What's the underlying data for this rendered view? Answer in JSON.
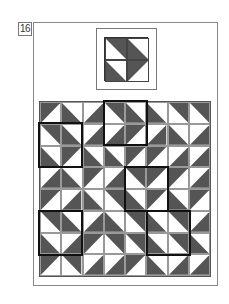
{
  "puzzle": {
    "number": "16",
    "dark_color": "#555555",
    "light_color": "#ffffff",
    "key": {
      "rows": 2,
      "cols": 2,
      "cells": [
        [
          "TR",
          "BL"
        ],
        [
          "BL",
          "TL"
        ]
      ]
    },
    "grid": {
      "rows": 8,
      "cols": 8,
      "cells": [
        [
          "TL",
          "BL",
          "BR",
          "TR",
          "BL",
          "BL",
          "TR",
          "TR"
        ],
        [
          "TR",
          "BL",
          "BR",
          "BR",
          "TL",
          "BR",
          "BL",
          "BR"
        ],
        [
          "BL",
          "TL",
          "BL",
          "BL",
          "TL",
          "TL",
          "BR",
          "BR"
        ],
        [
          "BR",
          "BL",
          "TL",
          "BR",
          "TR",
          "TL",
          "TL",
          "BR"
        ],
        [
          "TL",
          "BR",
          "BL",
          "TR",
          "BL",
          "TL",
          "BL",
          "TL"
        ],
        [
          "TR",
          "BL",
          "BR",
          "BL",
          "TR",
          "BL",
          "TR",
          "BR"
        ],
        [
          "BL",
          "BR",
          "TL",
          "TR",
          "TR",
          "BL",
          "TR",
          "BL"
        ],
        [
          "TL",
          "TR",
          "BR",
          "BR",
          "TL",
          "BL",
          "BR",
          "BR"
        ]
      ]
    },
    "highlighted_blocks": [
      {
        "row": 0,
        "col": 3,
        "size": 2
      },
      {
        "row": 1,
        "col": 0,
        "size": 2
      },
      {
        "row": 3,
        "col": 4,
        "size": 2
      },
      {
        "row": 5,
        "col": 0,
        "size": 2
      },
      {
        "row": 5,
        "col": 5,
        "size": 2
      }
    ]
  }
}
